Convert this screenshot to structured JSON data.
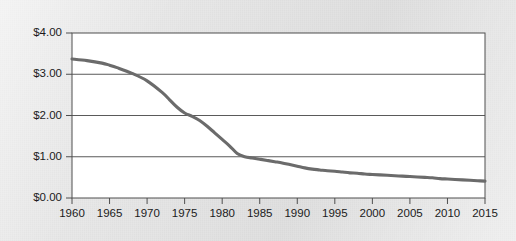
{
  "chart_data": {
    "type": "line",
    "title": "",
    "subtitle": "",
    "xlabel": "",
    "ylabel": "",
    "xlim": [
      1960,
      2015
    ],
    "ylim": [
      0,
      4
    ],
    "grid": "horizontal",
    "legend": "none",
    "y_tick_labels": [
      "$4.00",
      "$3.00",
      "$2.00",
      "$1.00",
      "$0.00"
    ],
    "y_tick_values": [
      4,
      3,
      2,
      1,
      0
    ],
    "x_tick_labels": [
      "1960",
      "1965",
      "1970",
      "1975",
      "1980",
      "1985",
      "1990",
      "1995",
      "2000",
      "2005",
      "2010",
      "2015"
    ],
    "x_tick_values": [
      1960,
      1965,
      1970,
      1975,
      1980,
      1985,
      1990,
      1995,
      2000,
      2005,
      2010,
      2015
    ],
    "series": [
      {
        "name": "price",
        "color": "#6b6b6b",
        "x": [
          1960,
          1962,
          1964,
          1965,
          1966,
          1968,
          1970,
          1972,
          1973,
          1974,
          1975,
          1976,
          1977,
          1978,
          1979,
          1980,
          1981,
          1982,
          1983,
          1984,
          1985,
          1986,
          1987,
          1988,
          1989,
          1990,
          1991,
          1992,
          1993,
          1994,
          1995,
          1996,
          1997,
          1998,
          1999,
          2000,
          2001,
          2002,
          2003,
          2004,
          2005,
          2006,
          2007,
          2008,
          2009,
          2010,
          2011,
          2012,
          2013,
          2014,
          2015
        ],
        "values": [
          3.37,
          3.33,
          3.27,
          3.22,
          3.16,
          3.02,
          2.84,
          2.56,
          2.38,
          2.2,
          2.06,
          1.98,
          1.88,
          1.74,
          1.58,
          1.42,
          1.26,
          1.08,
          1.0,
          0.97,
          0.94,
          0.91,
          0.88,
          0.85,
          0.81,
          0.77,
          0.73,
          0.7,
          0.68,
          0.66,
          0.65,
          0.63,
          0.61,
          0.6,
          0.58,
          0.57,
          0.56,
          0.55,
          0.54,
          0.53,
          0.52,
          0.51,
          0.5,
          0.49,
          0.47,
          0.46,
          0.45,
          0.44,
          0.43,
          0.42,
          0.41
        ]
      }
    ]
  }
}
